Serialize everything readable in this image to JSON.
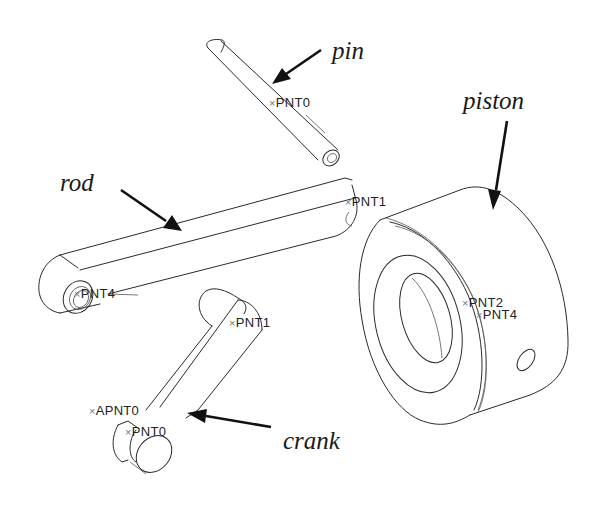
{
  "diagram": {
    "type": "exploded-assembly-isometric",
    "parts": [
      {
        "id": "pin",
        "label": "pin",
        "datum_points": [
          "PNT0"
        ]
      },
      {
        "id": "rod",
        "label": "rod",
        "datum_points": [
          "PNT1",
          "PNT4"
        ]
      },
      {
        "id": "piston",
        "label": "piston",
        "datum_points": [
          "PNT2",
          "PNT4"
        ]
      },
      {
        "id": "crank",
        "label": "crank",
        "datum_points": [
          "PNT1",
          "APNT0",
          "PNT0"
        ]
      }
    ]
  },
  "labels": {
    "pin": "pin",
    "rod": "rod",
    "piston": "piston",
    "crank": "crank"
  },
  "points": {
    "pin_pnt0": "PNT0",
    "rod_pnt1": "PNT1",
    "rod_pnt4": "PNT4",
    "piston_pnt2": "PNT2",
    "piston_pnt4": "PNT4",
    "crank_pnt1": "PNT1",
    "crank_apnt0": "APNT0",
    "crank_pnt0": "PNT0"
  },
  "marker": "×",
  "colors": {
    "line": "#2a2a2a",
    "arrow": "#111111",
    "background": "#ffffff"
  }
}
